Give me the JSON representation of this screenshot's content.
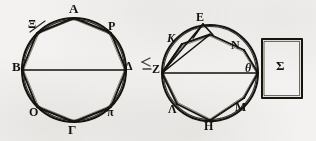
{
  "figure": {
    "background_color": "#f3f2f0",
    "ink_color": "#15120f",
    "left_diagram": {
      "name": "octagon-in-circle-left",
      "center": [
        74,
        70
      ],
      "radius": 52,
      "diameter_endpoints": [
        "B",
        "Δ"
      ],
      "vertices": [
        {
          "label": "A",
          "angle_deg": 90,
          "label_pos": [
            69,
            2
          ]
        },
        {
          "label": "P",
          "angle_deg": 45,
          "label_pos": [
            108,
            20
          ]
        },
        {
          "label": "Δ",
          "angle_deg": 0,
          "label_pos": [
            125,
            60
          ]
        },
        {
          "label": "π",
          "angle_deg": 315,
          "label_pos": [
            107,
            107
          ]
        },
        {
          "label": "Γ",
          "angle_deg": 270,
          "label_pos": [
            68,
            124
          ]
        },
        {
          "label": "O",
          "angle_deg": 225,
          "label_pos": [
            29,
            107
          ]
        },
        {
          "label": "B",
          "angle_deg": 180,
          "label_pos": [
            13,
            60
          ]
        },
        {
          "label": "Ξ",
          "angle_deg": 135,
          "label_pos": [
            28,
            19
          ]
        }
      ]
    },
    "right_diagram": {
      "name": "octagon-in-circle-right",
      "center": [
        210,
        73
      ],
      "radius": 48,
      "diameter_endpoints": [
        "Z",
        "θ"
      ],
      "apex_label": "E",
      "apex_note": "external point above circle joined to Z and to adjacent vertices",
      "vertices": [
        {
          "label": "Κ",
          "angle_deg": 126,
          "label_pos": [
            167,
            33
          ]
        },
        {
          "label": "N",
          "angle_deg": 50,
          "label_pos": [
            231,
            40
          ]
        },
        {
          "label": "θ",
          "angle_deg": 0,
          "label_pos": [
            246,
            63
          ]
        },
        {
          "label": "M",
          "angle_deg": 311,
          "label_pos": [
            235,
            102
          ]
        },
        {
          "label": "H",
          "angle_deg": 268,
          "label_pos": [
            205,
            121
          ]
        },
        {
          "label": "Λ",
          "angle_deg": 223,
          "label_pos": [
            169,
            105
          ]
        },
        {
          "label": "Z",
          "angle_deg": 180,
          "label_pos": [
            153,
            63
          ]
        },
        {
          "label": "E",
          "angle_deg": null,
          "label_pos": [
            196,
            12
          ]
        }
      ]
    },
    "rectangle": {
      "name": "sigma-rectangle",
      "label": "Σ",
      "x": 262,
      "y": 39,
      "width": 40,
      "height": 59,
      "label_pos": [
        276,
        59
      ]
    },
    "stray_mark": {
      "name": "margin-stray-mark",
      "label": "≃",
      "pos": [
        142,
        58
      ]
    }
  }
}
